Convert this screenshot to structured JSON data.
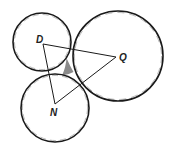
{
  "diagram": {
    "type": "tangent-circles-triangle",
    "colors": {
      "stroke": "#1a1a1a",
      "shaded_region": "#8a8a8a",
      "background": "#ffffff"
    },
    "circles": [
      {
        "id": "D",
        "cx": 42,
        "cy": 42,
        "r": 29
      },
      {
        "id": "Q",
        "cx": 118,
        "cy": 56,
        "r": 45
      },
      {
        "id": "N",
        "cx": 55,
        "cy": 108,
        "r": 34
      }
    ],
    "vertices": [
      {
        "id": "D",
        "x": 43,
        "y": 44,
        "label": "D",
        "label_x": 36,
        "label_y": 43
      },
      {
        "id": "Q",
        "x": 116,
        "y": 57,
        "label": "Q",
        "label_x": 119,
        "label_y": 61
      },
      {
        "id": "N",
        "x": 55,
        "y": 104,
        "label": "N",
        "label_x": 50,
        "label_y": 116
      }
    ],
    "triangle": [
      "D",
      "Q",
      "N"
    ],
    "shaded_region_description": "region bounded between the three mutually tangent circles"
  }
}
